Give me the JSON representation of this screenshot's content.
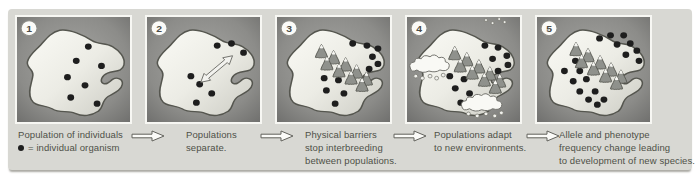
{
  "legend": {
    "icon": "individual-dot",
    "text": "= individual organism"
  },
  "steps": [
    {
      "number": "1",
      "caption": [
        "Population of individuals"
      ],
      "dots": [
        [
          65,
          29
        ],
        [
          54,
          43
        ],
        [
          77,
          48
        ],
        [
          46,
          59
        ],
        [
          62,
          67
        ],
        [
          49,
          79
        ],
        [
          73,
          85
        ]
      ],
      "mountains": []
    },
    {
      "number": "2",
      "caption": [
        "Populations",
        "separate."
      ],
      "dots": [
        [
          64,
          28
        ],
        [
          77,
          26
        ],
        [
          88,
          35
        ],
        [
          40,
          58
        ],
        [
          48,
          66
        ],
        [
          59,
          75
        ],
        [
          45,
          84
        ]
      ],
      "mountains": []
    },
    {
      "number": "3",
      "caption": [
        "Physical barriers",
        "stop interbreeding",
        "between populations."
      ],
      "dots": [
        [
          69,
          26
        ],
        [
          82,
          28
        ],
        [
          92,
          31
        ],
        [
          87,
          39
        ],
        [
          92,
          46
        ],
        [
          84,
          51
        ],
        [
          43,
          60
        ],
        [
          56,
          62
        ],
        [
          45,
          72
        ],
        [
          61,
          75
        ],
        [
          53,
          85
        ]
      ],
      "mountains": [
        [
          34,
          26
        ],
        [
          45,
          32
        ],
        [
          39,
          38
        ],
        [
          56,
          39
        ],
        [
          50,
          45
        ],
        [
          66,
          46
        ],
        [
          61,
          52
        ],
        [
          75,
          53
        ],
        [
          71,
          59
        ]
      ]
    },
    {
      "number": "4",
      "caption": [
        "Populations adapt",
        "to new environments."
      ],
      "dots": [
        [
          71,
          28
        ],
        [
          83,
          30
        ],
        [
          91,
          38
        ],
        [
          78,
          41
        ],
        [
          92,
          47
        ],
        [
          83,
          53
        ],
        [
          39,
          58
        ],
        [
          52,
          61
        ],
        [
          44,
          70
        ],
        [
          57,
          75
        ],
        [
          49,
          84
        ]
      ],
      "mountains": [
        [
          37,
          28
        ],
        [
          48,
          34
        ],
        [
          42,
          40
        ],
        [
          59,
          41
        ],
        [
          53,
          47
        ],
        [
          69,
          48
        ],
        [
          64,
          54
        ],
        [
          78,
          55
        ],
        [
          74,
          61
        ]
      ]
    },
    {
      "number": "5",
      "caption": [
        "Allele and phenotype",
        "frequency change leading",
        "to development of new species."
      ],
      "dots": [
        [
          25,
          53
        ],
        [
          35,
          43
        ],
        [
          39,
          53
        ],
        [
          45,
          61
        ],
        [
          33,
          63
        ],
        [
          39,
          73
        ],
        [
          47,
          81
        ],
        [
          53,
          73
        ],
        [
          55,
          86
        ],
        [
          61,
          81
        ],
        [
          57,
          21
        ],
        [
          67,
          18
        ],
        [
          79,
          18
        ],
        [
          73,
          27
        ],
        [
          85,
          26
        ],
        [
          91,
          33
        ],
        [
          81,
          37
        ],
        [
          93,
          43
        ]
      ],
      "mountains": [
        [
          29,
          24
        ],
        [
          40,
          30
        ],
        [
          34,
          36
        ],
        [
          51,
          37
        ],
        [
          45,
          43
        ],
        [
          61,
          44
        ],
        [
          56,
          50
        ],
        [
          70,
          51
        ],
        [
          66,
          57
        ]
      ]
    }
  ],
  "colors": {
    "board_bg": "#d8d8d3",
    "panel_bg_center": "#a6a6a3",
    "panel_bg_edge": "#6f6f6d",
    "habitat_light": "#fafaf5",
    "habitat_dark": "#cbcbc3",
    "individual_dot": "#1e1e1e",
    "mountain": "#8f918c",
    "snow_cap": "#f5f5f1",
    "caption_text": "#4e5047",
    "arrow_fill": "#fbfbf8"
  }
}
